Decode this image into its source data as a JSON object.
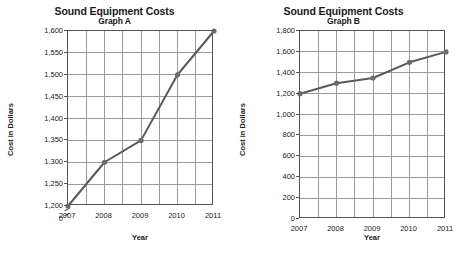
{
  "chart_data": [
    {
      "type": "line",
      "title": "Sound Equipment Costs",
      "subtitle": "Graph A",
      "xlabel": "Year",
      "ylabel": "Cost in Dollars",
      "x": [
        "2007",
        "2008",
        "2009",
        "2010",
        "2011"
      ],
      "values": [
        1200,
        1300,
        1350,
        1500,
        1600
      ],
      "series": [
        {
          "name": "Cost",
          "values": [
            1200,
            1300,
            1350,
            1500,
            1600
          ]
        }
      ],
      "ylim": [
        1200,
        1600
      ],
      "ytick_values": [
        1200,
        1250,
        1300,
        1350,
        1400,
        1450,
        1500,
        1550,
        1600
      ],
      "ytick_labels": [
        "1,200",
        "1,250",
        "1,300",
        "1,350",
        "1,400",
        "1,450",
        "1,500",
        "1,550",
        "1,600"
      ],
      "zero_tick_label": "0",
      "axis_break": true,
      "grid": true,
      "legend": "none",
      "line_color": "#5a5a5a",
      "marker_color": "#6b6b6b"
    },
    {
      "type": "line",
      "title": "Sound Equipment Costs",
      "subtitle": "Graph B",
      "xlabel": "Year",
      "ylabel": "Cost in Dollars",
      "x": [
        "2007",
        "2008",
        "2009",
        "2010",
        "2011"
      ],
      "values": [
        1200,
        1300,
        1350,
        1500,
        1600
      ],
      "series": [
        {
          "name": "Cost",
          "values": [
            1200,
            1300,
            1350,
            1500,
            1600
          ]
        }
      ],
      "ylim": [
        0,
        1800
      ],
      "ytick_values": [
        0,
        200,
        400,
        600,
        800,
        1000,
        1200,
        1400,
        1600,
        1800
      ],
      "ytick_labels": [
        "0",
        "200",
        "400",
        "600",
        "800",
        "1,000",
        "1,200",
        "1,400",
        "1,600",
        "1,800"
      ],
      "axis_break": false,
      "grid": true,
      "legend": "none",
      "line_color": "#5a5a5a",
      "marker_color": "#6b6b6b"
    }
  ],
  "graph_a": {
    "title": "Sound Equipment Costs",
    "subtitle": "Graph A",
    "xlabel": "Year",
    "ylabel": "Cost in Dollars",
    "ytick_labels": [
      "1,600",
      "1,550",
      "1,500",
      "1,450",
      "1,400",
      "1,350",
      "1,300",
      "1,250",
      "1,200"
    ],
    "zero_label": "0",
    "xtick_labels": [
      "2007",
      "2008",
      "2009",
      "2010",
      "2011"
    ]
  },
  "graph_b": {
    "title": "Sound Equipment Costs",
    "subtitle": "Graph B",
    "xlabel": "Year",
    "ylabel": "Cost in Dollars",
    "ytick_labels": [
      "1,800",
      "1,600",
      "1,400",
      "1,200",
      "1,000",
      "800",
      "600",
      "400",
      "200",
      "0"
    ],
    "xtick_labels": [
      "2007",
      "2008",
      "2009",
      "2010",
      "2011"
    ]
  }
}
